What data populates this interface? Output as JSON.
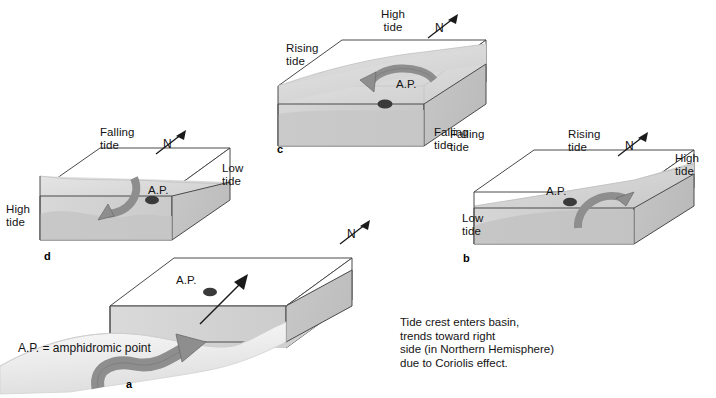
{
  "figure": {
    "legend": "A.P. = amphidromic point",
    "caption": "Tide crest enters basin,\ntrends toward right\nside (in Northern Hemisphere)\ndue to Coriolis effect.",
    "ap_label": "A.P.",
    "compass_label": "N",
    "colors": {
      "water_surface": "#d9d9d9",
      "front_face": "#cfcfcf",
      "side_face": "#c2c2c2",
      "deep_water": "#bdbdbd",
      "arrow": "#8e8e8e",
      "arrow_stroke": "#5a5a5a",
      "outline": "#4a4a4a",
      "ap_dot": "#3a3a3a",
      "text": "#141414",
      "background": "#ffffff"
    }
  },
  "panels": [
    {
      "letter": "a",
      "labels": [],
      "compass": "N",
      "ap_label": "A.P.",
      "description": "Tide crest entering basin"
    },
    {
      "letter": "b",
      "labels": [
        {
          "text": "Rising\ntide",
          "position": "top"
        },
        {
          "text": "High\ntide",
          "position": "right"
        },
        {
          "text": "Low\ntide",
          "position": "left"
        },
        {
          "text": "Falling\ntide",
          "position": "top-left"
        }
      ],
      "compass": "N",
      "ap_label": "A.P."
    },
    {
      "letter": "c",
      "labels": [
        {
          "text": "High\ntide",
          "position": "top-right"
        },
        {
          "text": "Rising\ntide",
          "position": "left"
        },
        {
          "text": "Falling\ntide",
          "position": "bottom-right"
        }
      ],
      "compass": "N",
      "ap_label": "A.P."
    },
    {
      "letter": "d",
      "labels": [
        {
          "text": "Falling\ntide",
          "position": "top-right"
        },
        {
          "text": "High\ntide",
          "position": "left"
        },
        {
          "text": "Low\ntide",
          "position": "right"
        }
      ],
      "compass": "N",
      "ap_label": "A.P."
    }
  ]
}
